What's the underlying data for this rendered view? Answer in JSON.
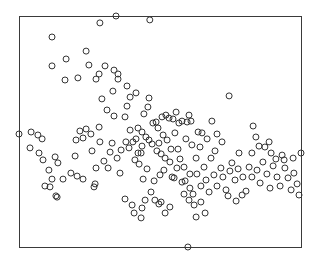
{
  "chart_data": {
    "type": "scatter",
    "title": "",
    "xlabel": "",
    "ylabel": "",
    "xlim": [
      0,
      100
    ],
    "ylim": [
      0,
      100
    ],
    "grid": false,
    "legend": null,
    "axes_ticks_visible": false,
    "marker": "open-circle",
    "colors": {
      "marker": "#333333",
      "frame": "#3a3a3a",
      "background": "#ffffff"
    },
    "plot_box_px": {
      "left": 19,
      "top": 16,
      "right": 301,
      "bottom": 247
    },
    "points": [
      [
        34.4,
        100.0
      ],
      [
        28.7,
        97.0
      ],
      [
        11.7,
        90.9
      ],
      [
        46.4,
        98.3
      ],
      [
        11.7,
        78.4
      ],
      [
        16.7,
        81.4
      ],
      [
        23.8,
        84.8
      ],
      [
        16.3,
        72.3
      ],
      [
        20.9,
        73.2
      ],
      [
        24.8,
        78.8
      ],
      [
        28.4,
        74.9
      ],
      [
        30.5,
        78.4
      ],
      [
        27.3,
        72.7
      ],
      [
        33.7,
        76.6
      ],
      [
        33.3,
        67.5
      ],
      [
        35.1,
        74.9
      ],
      [
        35.1,
        72.7
      ],
      [
        38.3,
        69.7
      ],
      [
        39.4,
        64.9
      ],
      [
        38.3,
        61.0
      ],
      [
        37.6,
        56.3
      ],
      [
        41.5,
        66.7
      ],
      [
        44.3,
        57.6
      ],
      [
        45.7,
        60.6
      ],
      [
        39.4,
        50.6
      ],
      [
        42.2,
        51.5
      ],
      [
        43.6,
        49.8
      ],
      [
        46.1,
        46.3
      ],
      [
        48.6,
        54.1
      ],
      [
        56.7,
        53.7
      ],
      [
        57.8,
        54.5
      ],
      [
        59.6,
        54.1
      ],
      [
        61.0,
        54.5
      ],
      [
        60.3,
        57.1
      ],
      [
        64.9,
        49.4
      ],
      [
        68.4,
        54.5
      ],
      [
        70.2,
        48.9
      ],
      [
        74.5,
        65.4
      ],
      [
        78.0,
        40.7
      ],
      [
        82.6,
        40.7
      ],
      [
        83.0,
        52.4
      ],
      [
        84.0,
        47.6
      ],
      [
        85.1,
        43.7
      ],
      [
        87.2,
        43.3
      ],
      [
        88.7,
        45.5
      ],
      [
        89.4,
        40.7
      ],
      [
        91.1,
        38.1
      ],
      [
        93.3,
        39.8
      ],
      [
        94.0,
        37.7
      ],
      [
        97.2,
        38.5
      ],
      [
        100.0,
        40.7
      ],
      [
        4.3,
        49.8
      ],
      [
        6.7,
        48.5
      ],
      [
        8.2,
        46.8
      ],
      [
        3.9,
        42.9
      ],
      [
        7.1,
        40.7
      ],
      [
        8.5,
        37.7
      ],
      [
        12.8,
        39.0
      ],
      [
        13.8,
        36.4
      ],
      [
        10.6,
        33.3
      ],
      [
        11.7,
        29.4
      ],
      [
        15.6,
        29.4
      ],
      [
        19.9,
        39.4
      ],
      [
        18.4,
        32.0
      ],
      [
        20.2,
        46.3
      ],
      [
        22.7,
        47.2
      ],
      [
        21.6,
        50.2
      ],
      [
        23.8,
        51.1
      ],
      [
        25.5,
        48.9
      ],
      [
        28.4,
        51.9
      ],
      [
        28.7,
        45.5
      ],
      [
        0.0,
        48.9
      ],
      [
        13.1,
        22.1
      ],
      [
        13.5,
        21.6
      ],
      [
        9.2,
        26.4
      ],
      [
        11.0,
        26.0
      ],
      [
        20.6,
        30.7
      ],
      [
        22.7,
        29.4
      ],
      [
        26.6,
        26.0
      ],
      [
        27.0,
        27.3
      ],
      [
        31.6,
        34.2
      ],
      [
        35.8,
        32.0
      ],
      [
        37.9,
        45.5
      ],
      [
        39.0,
        42.9
      ],
      [
        40.4,
        45.5
      ],
      [
        41.5,
        46.8
      ],
      [
        42.2,
        40.7
      ],
      [
        41.1,
        37.7
      ],
      [
        43.6,
        43.7
      ],
      [
        43.3,
        40.7
      ],
      [
        42.6,
        35.9
      ],
      [
        45.0,
        47.6
      ],
      [
        47.2,
        44.6
      ],
      [
        48.9,
        41.6
      ],
      [
        49.6,
        45.0
      ],
      [
        50.4,
        40.3
      ],
      [
        44.0,
        29.4
      ],
      [
        45.4,
        33.8
      ],
      [
        47.9,
        28.6
      ],
      [
        50.0,
        31.2
      ],
      [
        51.4,
        33.3
      ],
      [
        51.8,
        38.5
      ],
      [
        53.5,
        36.8
      ],
      [
        55.0,
        29.9
      ],
      [
        37.6,
        20.8
      ],
      [
        40.1,
        18.2
      ],
      [
        40.8,
        14.7
      ],
      [
        43.6,
        16.9
      ],
      [
        43.3,
        12.6
      ],
      [
        44.7,
        20.3
      ],
      [
        46.8,
        23.8
      ],
      [
        48.2,
        20.3
      ],
      [
        50.4,
        19.5
      ],
      [
        49.6,
        18.6
      ],
      [
        51.8,
        14.7
      ],
      [
        53.5,
        17.3
      ],
      [
        54.3,
        30.3
      ],
      [
        56.0,
        34.2
      ],
      [
        57.1,
        38.1
      ],
      [
        58.5,
        34.6
      ],
      [
        57.8,
        28.1
      ],
      [
        60.6,
        31.6
      ],
      [
        58.5,
        22.9
      ],
      [
        60.3,
        20.3
      ],
      [
        61.7,
        22.9
      ],
      [
        62.8,
        38.5
      ],
      [
        63.1,
        31.6
      ],
      [
        64.5,
        26.4
      ],
      [
        65.6,
        34.6
      ],
      [
        66.3,
        29.0
      ],
      [
        67.4,
        23.8
      ],
      [
        68.1,
        38.5
      ],
      [
        69.1,
        31.2
      ],
      [
        70.2,
        26.4
      ],
      [
        71.6,
        34.2
      ],
      [
        72.3,
        30.3
      ],
      [
        73.4,
        24.7
      ],
      [
        74.8,
        32.9
      ],
      [
        75.5,
        36.4
      ],
      [
        76.6,
        29.0
      ],
      [
        77.7,
        33.8
      ],
      [
        79.4,
        30.3
      ],
      [
        80.5,
        24.2
      ],
      [
        81.6,
        34.6
      ],
      [
        82.6,
        30.3
      ],
      [
        84.4,
        33.3
      ],
      [
        85.5,
        27.7
      ],
      [
        86.5,
        36.8
      ],
      [
        87.9,
        31.6
      ],
      [
        89.0,
        25.5
      ],
      [
        90.1,
        35.1
      ],
      [
        91.5,
        30.3
      ],
      [
        92.6,
        26.4
      ],
      [
        94.3,
        34.2
      ],
      [
        95.4,
        29.9
      ],
      [
        96.5,
        24.7
      ],
      [
        97.5,
        32.0
      ],
      [
        98.6,
        27.3
      ],
      [
        99.3,
        22.5
      ],
      [
        64.2,
        43.3
      ],
      [
        66.7,
        46.8
      ],
      [
        69.5,
        41.6
      ],
      [
        72.0,
        45.5
      ],
      [
        52.5,
        46.3
      ],
      [
        53.9,
        42.4
      ],
      [
        55.3,
        49.4
      ],
      [
        56.4,
        42.4
      ],
      [
        59.2,
        46.8
      ],
      [
        61.3,
        44.2
      ],
      [
        63.5,
        49.8
      ],
      [
        47.5,
        53.7
      ],
      [
        49.3,
        51.5
      ],
      [
        51.1,
        48.5
      ],
      [
        50.7,
        56.3
      ],
      [
        52.1,
        57.1
      ],
      [
        53.2,
        55.8
      ],
      [
        54.6,
        55.4
      ],
      [
        55.7,
        58.4
      ],
      [
        25.9,
        41.6
      ],
      [
        27.3,
        34.2
      ],
      [
        30.1,
        37.2
      ],
      [
        32.3,
        41.1
      ],
      [
        33.0,
        45.0
      ],
      [
        34.8,
        38.5
      ],
      [
        36.2,
        42.0
      ],
      [
        33.7,
        56.7
      ],
      [
        31.2,
        59.3
      ],
      [
        29.4,
        64.1
      ],
      [
        46.1,
        64.5
      ],
      [
        58.9,
        28.6
      ],
      [
        60.6,
        25.5
      ],
      [
        62.1,
        18.2
      ],
      [
        64.5,
        19.5
      ],
      [
        66.0,
        14.7
      ],
      [
        62.8,
        13.0
      ],
      [
        59.9,
        0.0
      ],
      [
        74.1,
        22.1
      ],
      [
        77.0,
        19.9
      ],
      [
        79.1,
        22.5
      ]
    ]
  }
}
